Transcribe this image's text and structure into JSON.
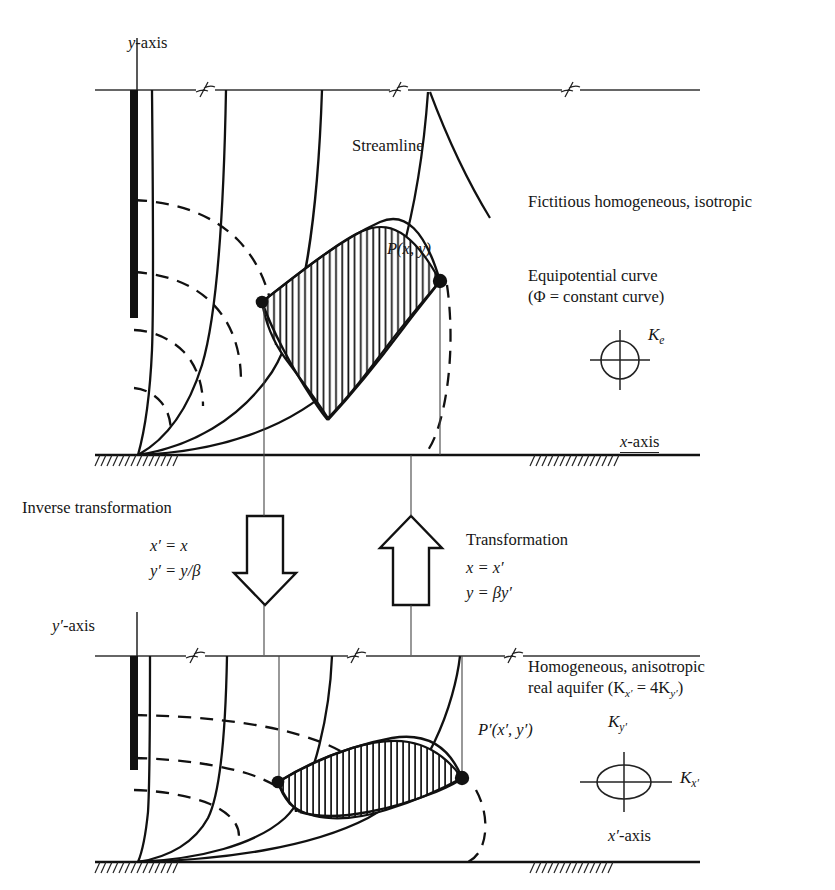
{
  "figure": {
    "kind": "hydrogeology-flow-net-transformation",
    "background_color": "#ffffff",
    "ink_color": "#161616"
  },
  "top_panel": {
    "caption": "Fictitious homogeneous, isotropic",
    "y_axis_label": "y-axis",
    "x_axis_label": "x-axis",
    "streamline_label": "Streamline",
    "equipotential_label_line1": "Equipotential curve",
    "equipotential_label_line2": "(Φ = constant curve)",
    "point_label": "P(x, y)",
    "conductivity_symbol": "K",
    "conductivity_subscript": "e",
    "conductivity_label": "Kₑ",
    "indicator_shape": "circle"
  },
  "transform_down": {
    "title": "Inverse transformation",
    "equation_1": "x′ = x",
    "equation_2": "y′ = y/β",
    "arrow_direction": "down"
  },
  "transform_up": {
    "title": "Transformation",
    "equation_1": "x = x′",
    "equation_2": "y = βy′",
    "arrow_direction": "up"
  },
  "bottom_panel": {
    "caption_line1": "Homogeneous, anisotropic",
    "caption_line2_prefix": "real aquifer (K",
    "caption_line2_sub1": "x′",
    "caption_line2_mid": " = 4K",
    "caption_line2_sub2": "y′",
    "caption_line2_suffix": ")",
    "caption_line2_full": "real aquifer (Kx′ = 4Ky′)",
    "y_axis_label": "y′-axis",
    "x_axis_label": "x′-axis",
    "point_label": "P′(x′, y′)",
    "conductivity_vertical": "K",
    "conductivity_vertical_sub": "y′",
    "conductivity_horizontal": "K",
    "conductivity_horizontal_sub": "x′",
    "indicator_shape": "ellipse-wide"
  },
  "legend_notes": {
    "solid_curve_meaning": "Streamline",
    "dashed_curve_meaning": "Equipotential curve"
  }
}
